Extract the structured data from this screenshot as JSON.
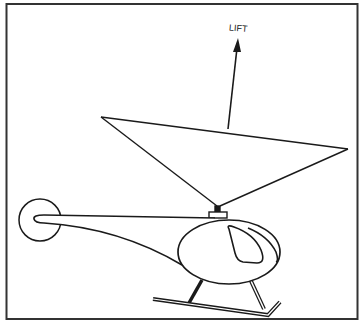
{
  "figure": {
    "type": "line-drawing",
    "labels": {
      "lift": "LIFT"
    },
    "colors": {
      "stroke": "#1a1a1a",
      "background": "#ffffff",
      "frame": "#333333"
    },
    "elements": [
      "frame",
      "lift-arrow",
      "rotor-disk-cone",
      "rotor-hub",
      "tail-rotor",
      "tail-boom",
      "cabin",
      "windshield",
      "landing-skid"
    ]
  }
}
